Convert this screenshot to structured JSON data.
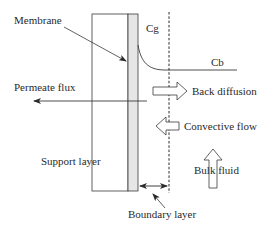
{
  "diagram": {
    "labels": {
      "membrane": "Membrane",
      "cg": "Cg",
      "cb": "Cb",
      "permeate_flux": "Permeate flux",
      "back_diffusion": "Back diffusion",
      "convective_flow": "Convective flow",
      "support_layer": "Support layer",
      "bulk_fluid": "Bulk fluid",
      "boundary_layer": "Boundary layer"
    },
    "colors": {
      "line": "#3a3a3a",
      "membrane_fill": "#e6e6e6",
      "background": "#ffffff"
    }
  }
}
